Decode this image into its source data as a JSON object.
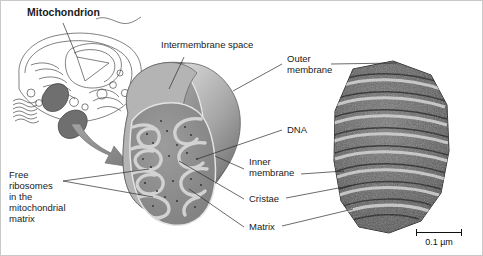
{
  "figure": {
    "title": "Mitochondrion",
    "scale_bar": {
      "label": "0.1 µm"
    }
  },
  "labels": {
    "mitochondrion": "Mitochondrion",
    "intermembrane_space": "Intermembrane space",
    "outer_membrane": "Outer\nmembrane",
    "dna": "DNA",
    "inner_membrane": "Inner\nmembrane",
    "cristae": "Cristae",
    "matrix": "Matrix",
    "free_ribosomes": "Free\nribosomes\nin the\nmitochondrial\nmatrix"
  },
  "panels": {
    "cell_diagram": "eukaryotic-cell-line-drawing",
    "arrow": "curved-zoom-arrow",
    "illustration": "mitochondrion-cutaway-illustration",
    "micrograph": "mitochondrion-tem-micrograph"
  },
  "colors": {
    "ink": "#1a1a1a",
    "leader": "#2b2b2b",
    "membrane_light": "#d8d8d8",
    "membrane_mid": "#9a9a9a",
    "membrane_dark": "#6d6d6d",
    "matrix_gray": "#8d8d8d",
    "crista_light": "#cfcfcf",
    "arrow_gray": "#8a8a8a",
    "tem_dark": "#3b3b3b",
    "tem_mid": "#6f6f6f",
    "tem_light": "#a9a9a9",
    "background": "#ffffff"
  }
}
